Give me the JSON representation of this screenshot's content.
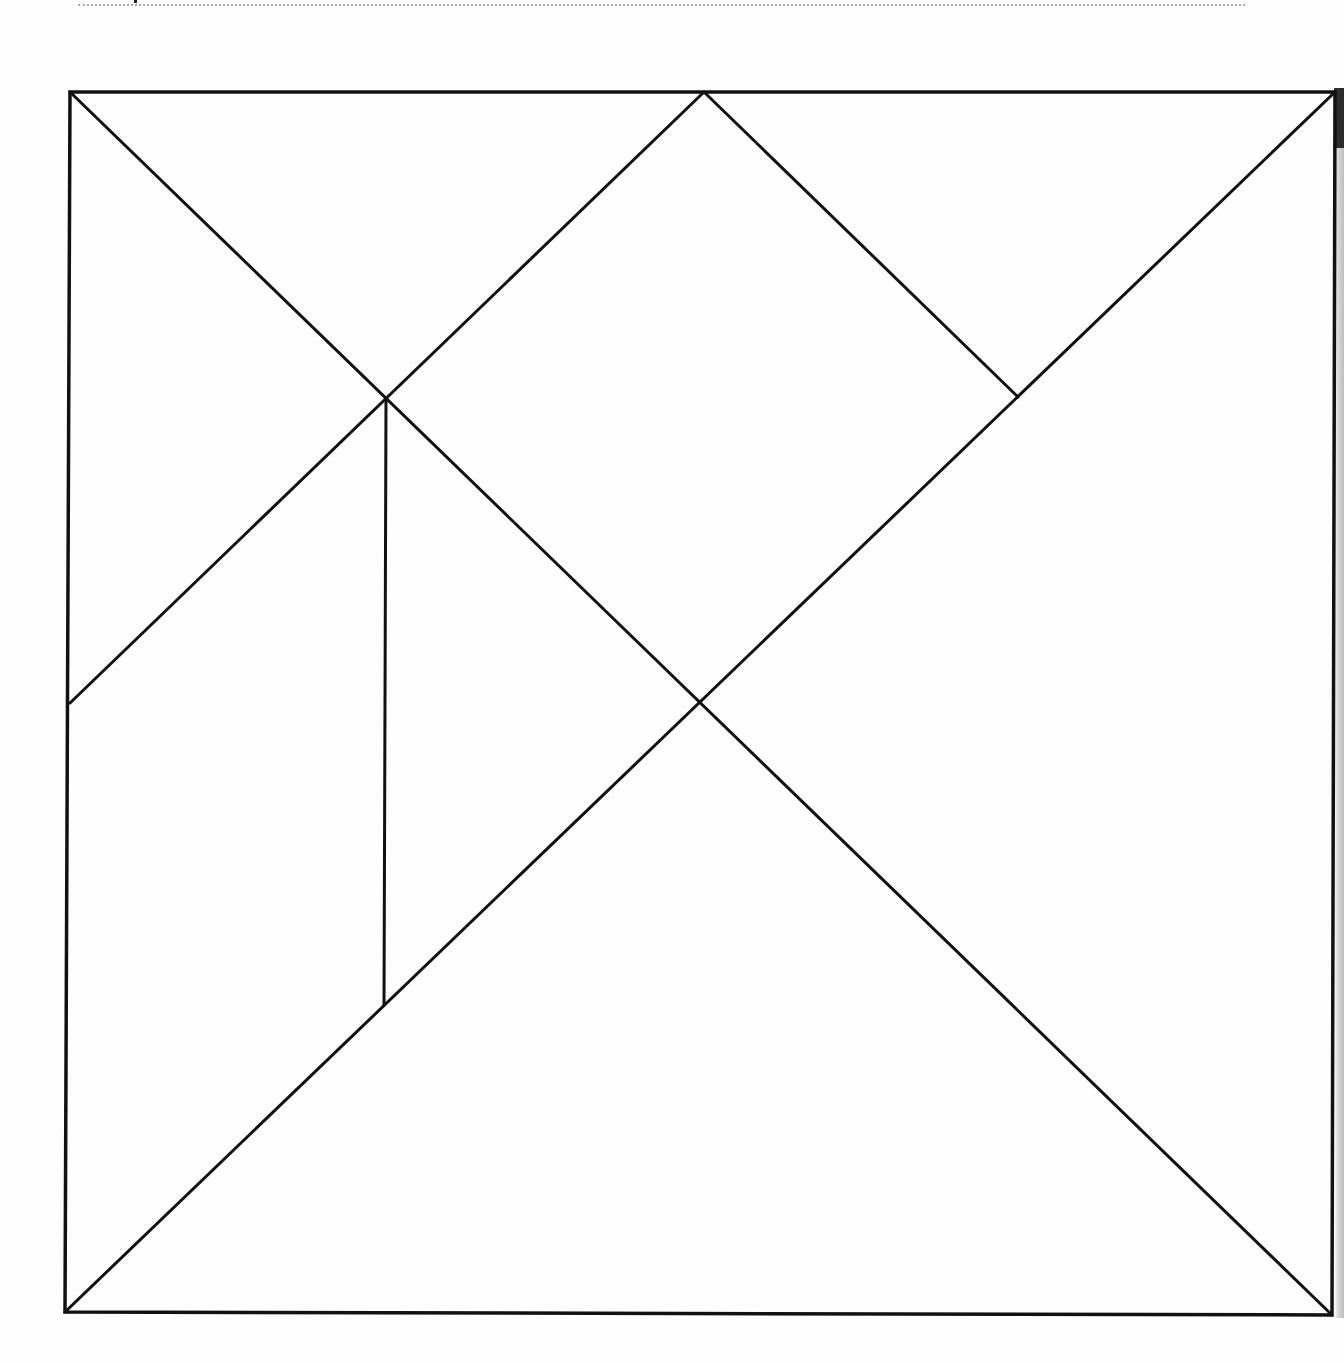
{
  "figure": {
    "title": "Tangram square outline",
    "stroke_color": "#111111",
    "stroke_width": 3,
    "outer_square": {
      "top_left": [
        70,
        92
      ],
      "top_right": [
        1335,
        92
      ],
      "bottom_right": [
        1332,
        1315
      ],
      "bottom_left": [
        65,
        1312
      ]
    },
    "vertices": {
      "top_mid": [
        704,
        92
      ],
      "upper_left_cross": [
        386,
        398
      ],
      "upper_right_corner": [
        1018,
        397
      ],
      "left_mid": [
        70,
        703
      ],
      "center": [
        702,
        703
      ],
      "lower_left_foot": [
        384,
        1005
      ]
    },
    "pieces": [
      {
        "name": "large-triangle-bottom",
        "points": [
          [
            65,
            1312
          ],
          [
            1332,
            1315
          ],
          [
            702,
            703
          ]
        ]
      },
      {
        "name": "large-triangle-right",
        "points": [
          [
            1335,
            92
          ],
          [
            1332,
            1315
          ],
          [
            702,
            703
          ]
        ]
      },
      {
        "name": "medium-triangle-top-left",
        "points": [
          [
            70,
            92
          ],
          [
            704,
            92
          ],
          [
            386,
            398
          ]
        ]
      },
      {
        "name": "square-center",
        "points": [
          [
            704,
            92
          ],
          [
            1018,
            397
          ],
          [
            702,
            703
          ],
          [
            386,
            398
          ]
        ]
      },
      {
        "name": "small-triangle-top-right",
        "points": [
          [
            704,
            92
          ],
          [
            1335,
            92
          ],
          [
            1018,
            397
          ]
        ]
      },
      {
        "name": "triangle-left",
        "points": [
          [
            70,
            92
          ],
          [
            386,
            398
          ],
          [
            70,
            703
          ]
        ]
      },
      {
        "name": "parallelogram-left",
        "points": [
          [
            70,
            703
          ],
          [
            386,
            398
          ],
          [
            384,
            1005
          ],
          [
            65,
            1312
          ]
        ]
      },
      {
        "name": "small-triangle-center",
        "points": [
          [
            386,
            398
          ],
          [
            702,
            703
          ],
          [
            384,
            1005
          ]
        ]
      }
    ],
    "segments": [
      {
        "name": "diagonal-main-desc",
        "from": [
          70,
          92
        ],
        "to": [
          1332,
          1315
        ]
      },
      {
        "name": "diagonal-main-asc",
        "from": [
          65,
          1312
        ],
        "to": [
          1335,
          92
        ]
      },
      {
        "name": "top-mid-to-left-mid",
        "from": [
          704,
          92
        ],
        "to": [
          70,
          703
        ]
      },
      {
        "name": "top-mid-to-right",
        "from": [
          704,
          92
        ],
        "to": [
          1018,
          397
        ]
      },
      {
        "name": "vertical-inner",
        "from": [
          386,
          398
        ],
        "to": [
          384,
          1005
        ]
      }
    ]
  },
  "header_rule": {
    "visible": true,
    "color": "#a9a9a9"
  }
}
